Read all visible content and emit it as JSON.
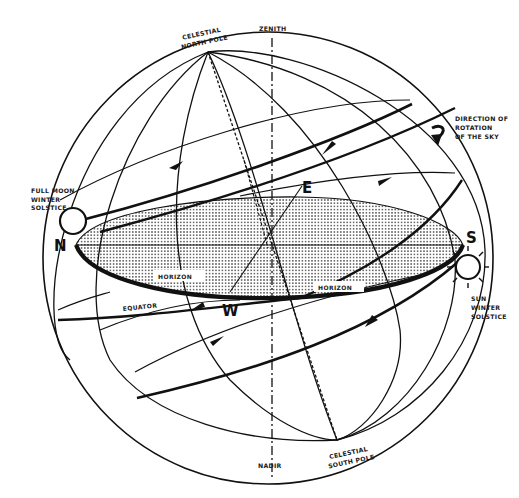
{
  "diagram": {
    "type": "celestial-sphere",
    "colors": {
      "ink": "#111111",
      "background": "#ffffff",
      "horizon_fill_dots": "#555555"
    },
    "labels": {
      "celestial_north_pole": [
        "CELESTIAL",
        "NORTH POLE"
      ],
      "zenith": "ZENITH",
      "direction_of_rotation": [
        "DIRECTION OF",
        "ROTATION",
        "OF THE SKY"
      ],
      "full_moon": [
        "FULL MOON",
        "WINTER",
        "SOLSTICE"
      ],
      "sun": [
        "SUN",
        "WINTER",
        "SOLSTICE"
      ],
      "equator": "EQUATOR",
      "horizon_left": "HORIZON",
      "horizon_right": "HORIZON",
      "nadir": "NADIR",
      "celestial_south_pole": [
        "CELESTIAL",
        "SOUTH POLE"
      ],
      "north": "N",
      "south": "S",
      "east": "E",
      "west": "W"
    },
    "icons": {
      "moon": "moon-circle-icon",
      "sun": "sun-rays-icon",
      "rotation": "curved-arrow-icon"
    }
  }
}
